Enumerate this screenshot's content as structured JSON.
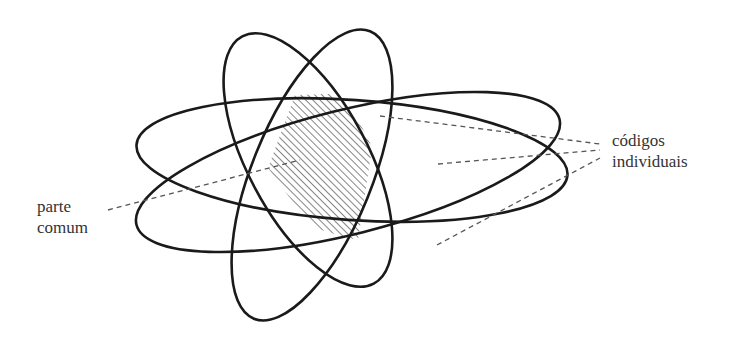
{
  "diagram": {
    "type": "venn-overlap",
    "colors": {
      "stroke": "#1a1a1a",
      "hatch": "#444444",
      "dashed": "#555555",
      "text": "#333333",
      "background": "#ffffff"
    },
    "labels": {
      "common_part": [
        "parte",
        "comum"
      ],
      "individual_codes": [
        "códigos",
        "individuais"
      ]
    },
    "ellipse_count": 4,
    "hatched_region": "parte comum"
  }
}
